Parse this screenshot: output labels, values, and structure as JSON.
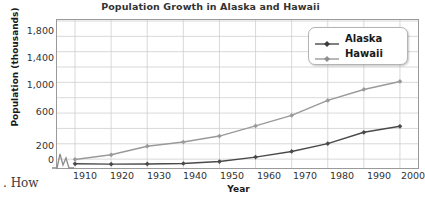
{
  "chart_data": {
    "type": "line",
    "title": "Population Growth in Alaska and Hawaii",
    "xlabel": "Year",
    "ylabel": "Population (thousands)",
    "categories": [
      "1910",
      "1920",
      "1930",
      "1940",
      "1950",
      "1960",
      "1970",
      "1980",
      "1990",
      "2000"
    ],
    "x": [
      1910,
      1920,
      1930,
      1940,
      1950,
      1960,
      1970,
      1980,
      1990,
      2000
    ],
    "series": [
      {
        "name": "Alaska",
        "color": "#4a4a4a",
        "marker": "diamond",
        "values": [
          64,
          55,
          59,
          73,
          129,
          226,
          300,
          402,
          550,
          627
        ]
      },
      {
        "name": "Hawaii",
        "color": "#9a9a9a",
        "marker": "diamond",
        "values": [
          192,
          256,
          368,
          423,
          500,
          633,
          770,
          965,
          1108,
          1212
        ]
      }
    ],
    "ylim": [
      0,
      2000
    ],
    "yticks": [
      0,
      200,
      600,
      1000,
      1400,
      1800
    ],
    "ytick_labels": [
      "0",
      "200",
      "600",
      "1,000",
      "1,400",
      "1,800"
    ],
    "y_minor_gridlines": [
      400,
      800,
      1200,
      1600,
      2000
    ],
    "xlim": [
      1905,
      2005
    ],
    "grid": true,
    "legend_position": "top-right",
    "axis_break": true,
    "axis_break_note": "zigzag break on vertical axis between 0 and 200"
  },
  "page": {
    "bleed_text": ". How"
  }
}
